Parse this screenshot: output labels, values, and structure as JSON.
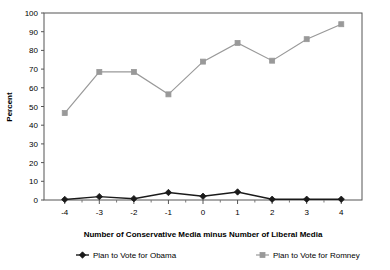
{
  "chart_data": {
    "type": "line",
    "title": "",
    "xlabel": "Number of Conservative Media minus Number of Liberal Media",
    "ylabel": "Percent",
    "x": [
      -4,
      -3,
      -2,
      -1,
      0,
      1,
      2,
      3,
      4
    ],
    "xticklabels": [
      "-4",
      "-3",
      "-2",
      "-1",
      "0",
      "1",
      "2",
      "3",
      "4"
    ],
    "yticks": [
      0,
      10,
      20,
      30,
      40,
      50,
      60,
      70,
      80,
      90,
      100
    ],
    "yticklabels": [
      "0",
      "10",
      "20",
      "30",
      "40",
      "50",
      "60",
      "70",
      "80",
      "90",
      "100"
    ],
    "xlim": [
      -4.6,
      4.6
    ],
    "ylim": [
      0,
      100
    ],
    "grid": false,
    "legend_position": "bottom",
    "series": [
      {
        "name": "Plan to Vote for Obama",
        "color": "#1a1a1a",
        "marker": "diamond",
        "values": [
          0.3,
          1.8,
          0.7,
          4.0,
          2.0,
          4.3,
          0.4,
          0.4,
          0.4
        ]
      },
      {
        "name": "Plan to Vote for Romney",
        "color": "#999999",
        "marker": "square",
        "values": [
          46.5,
          68.5,
          68.5,
          56.5,
          74.0,
          84.0,
          74.5,
          86.0,
          94.0
        ]
      }
    ]
  },
  "legend": {
    "items": [
      {
        "label": "Plan to Vote for Obama",
        "color": "#1a1a1a",
        "marker": "diamond"
      },
      {
        "label": "Plan to Vote for Romney",
        "color": "#999999",
        "marker": "square"
      }
    ]
  }
}
